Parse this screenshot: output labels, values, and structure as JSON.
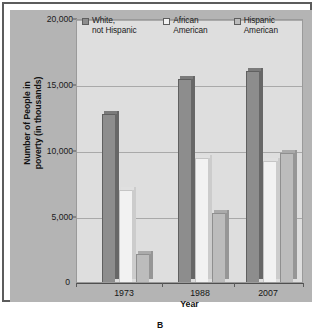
{
  "caption": "B",
  "legend": {
    "entries": [
      {
        "label": "White,\nnot Hispanic",
        "color": "#8d8d8d",
        "name": "white-not-hispanic"
      },
      {
        "label": "African\nAmerican",
        "color": "#f2f2f2",
        "name": "african-american"
      },
      {
        "label": "Hispanic\nAmerican",
        "color": "#bcbcbc",
        "name": "hispanic-american"
      }
    ]
  },
  "axes": {
    "y_title": "Number of People in\npoverty (in thousands)",
    "x_title": "Year",
    "y_ticks": [
      "0",
      "5,000",
      "10,000",
      "15,000",
      "20,000"
    ],
    "zero_label": "0"
  },
  "chart_data": {
    "type": "bar",
    "title": "",
    "xlabel": "Year",
    "ylabel": "Number of People in poverty (in thousands)",
    "categories": [
      "1973",
      "1988",
      "2007"
    ],
    "series": [
      {
        "name": "White, not Hispanic",
        "color": "#8d8d8d",
        "values": [
          12700,
          15400,
          16000
        ]
      },
      {
        "name": "African American",
        "color": "#f2f2f2",
        "values": [
          7000,
          9400,
          9200
        ]
      },
      {
        "name": "Hispanic American",
        "color": "#bcbcbc",
        "values": [
          2100,
          5200,
          9800
        ]
      }
    ],
    "ylim": [
      0,
      20000
    ],
    "yticks": [
      0,
      5000,
      10000,
      15000,
      20000
    ],
    "grid": true,
    "legend_position": "top"
  }
}
